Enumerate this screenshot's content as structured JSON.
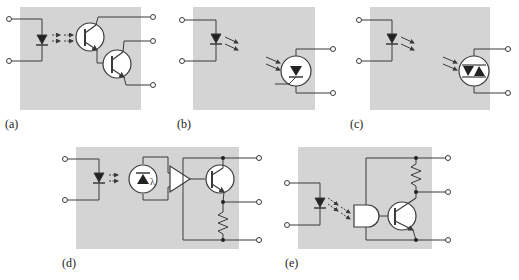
{
  "figure": {
    "panels": [
      {
        "id": "a",
        "label": "(a)",
        "device": "photodarlington"
      },
      {
        "id": "b",
        "label": "(b)",
        "device": "photo-SCR"
      },
      {
        "id": "c",
        "label": "(c)",
        "device": "photo-triac"
      },
      {
        "id": "d",
        "label": "(d)",
        "device": "photodiode-amplifier-transistor",
        "photodiode_symbol": "λ"
      },
      {
        "id": "e",
        "label": "(e)",
        "device": "schmitt-trigger-transistor"
      }
    ],
    "colors": {
      "background": "#ffffff",
      "panel_fill": "#d4d4d4",
      "line": "#3a3a3a",
      "component_fill": "#ffffff"
    }
  }
}
